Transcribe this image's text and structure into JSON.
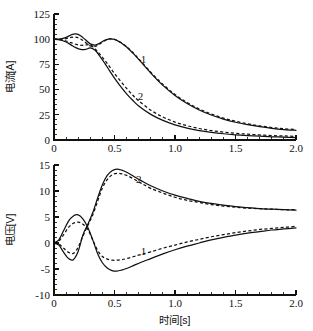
{
  "figure": {
    "title": "",
    "background": "#ffffff",
    "ink_color": "#111111",
    "width": 313,
    "height": 331
  },
  "chart_data": [
    {
      "id": "current-panel",
      "type": "line",
      "title": "",
      "xlabel": "",
      "ylabel": "电流[A]",
      "xlim": [
        0.0,
        2.0
      ],
      "ylim": [
        0,
        125
      ],
      "xticks": [
        0.0,
        0.5,
        1.0,
        1.5,
        2.0
      ],
      "xtick_labels": [
        "0",
        "0.5",
        "1.0",
        "1.5",
        "2.0"
      ],
      "yticks": [
        0,
        25,
        50,
        75,
        100,
        125
      ],
      "ytick_labels": [
        "0",
        "25",
        "50",
        "75",
        "100",
        "125"
      ],
      "minor_tick_count_x": 4,
      "minor_tick_count_y": 4,
      "grid": false,
      "legend": "inline-annotations",
      "annotations": [
        {
          "text": "1",
          "x": 0.74,
          "y": 76.0
        },
        {
          "text": "2",
          "x": 0.715,
          "y": 40.0
        }
      ],
      "series": [
        {
          "name": "1",
          "style": "solid",
          "x": [
            0.0,
            0.05,
            0.1,
            0.14,
            0.18,
            0.22,
            0.26,
            0.3,
            0.34,
            0.38,
            0.42,
            0.46,
            0.5,
            0.55,
            0.6,
            0.65,
            0.7,
            0.8,
            0.9,
            1.0,
            1.1,
            1.2,
            1.3,
            1.4,
            1.5,
            1.6,
            1.7,
            1.8,
            1.9,
            2.0
          ],
          "y": [
            100.0,
            100.2,
            101.8,
            104.2,
            105.2,
            103.4,
            99.4,
            95.4,
            94.2,
            96.2,
            99.0,
            100.3,
            99.8,
            96.8,
            92.2,
            86.4,
            80.0,
            66.4,
            54.2,
            44.2,
            36.2,
            29.8,
            24.8,
            20.8,
            17.6,
            15.2,
            13.2,
            11.6,
            10.4,
            9.6
          ]
        },
        {
          "name": "1-alt",
          "style": "dashed",
          "x": [
            0.0,
            0.05,
            0.1,
            0.14,
            0.18,
            0.22,
            0.26,
            0.3,
            0.34,
            0.38,
            0.42,
            0.46,
            0.5,
            0.55,
            0.6,
            0.65,
            0.7,
            0.8,
            0.9,
            1.0,
            1.1,
            1.2,
            1.3,
            1.4,
            1.5,
            1.6,
            1.7,
            1.8,
            1.9,
            2.0
          ],
          "y": [
            100.0,
            100.0,
            100.6,
            101.8,
            102.0,
            100.2,
            96.8,
            93.4,
            92.8,
            95.4,
            98.6,
            100.2,
            99.8,
            97.0,
            92.6,
            87.0,
            80.6,
            67.2,
            55.2,
            45.2,
            37.2,
            30.8,
            25.8,
            21.8,
            18.6,
            16.0,
            14.0,
            12.4,
            11.2,
            10.4
          ]
        },
        {
          "name": "2",
          "style": "solid",
          "x": [
            0.0,
            0.05,
            0.1,
            0.14,
            0.18,
            0.22,
            0.26,
            0.3,
            0.34,
            0.38,
            0.42,
            0.46,
            0.5,
            0.55,
            0.6,
            0.65,
            0.7,
            0.8,
            0.9,
            1.0,
            1.1,
            1.2,
            1.3,
            1.4,
            1.5,
            1.6,
            1.7,
            1.8,
            1.9,
            2.0
          ],
          "y": [
            100.0,
            99.4,
            97.2,
            94.4,
            91.6,
            89.8,
            89.8,
            91.4,
            89.0,
            83.0,
            76.0,
            68.6,
            61.4,
            53.2,
            45.8,
            39.4,
            33.8,
            25.4,
            19.4,
            15.0,
            11.8,
            9.4,
            7.6,
            6.2,
            5.2,
            4.4,
            3.8,
            3.2,
            2.8,
            2.4
          ]
        },
        {
          "name": "2-alt",
          "style": "dashed",
          "x": [
            0.0,
            0.05,
            0.1,
            0.14,
            0.18,
            0.22,
            0.26,
            0.3,
            0.34,
            0.38,
            0.42,
            0.46,
            0.5,
            0.55,
            0.6,
            0.65,
            0.7,
            0.8,
            0.9,
            1.0,
            1.1,
            1.2,
            1.3,
            1.4,
            1.5,
            1.6,
            1.7,
            1.8,
            1.9,
            2.0
          ],
          "y": [
            100.0,
            99.6,
            98.2,
            96.6,
            95.0,
            94.0,
            94.4,
            94.2,
            90.4,
            85.0,
            79.0,
            72.6,
            66.0,
            58.4,
            51.2,
            44.6,
            38.8,
            29.6,
            22.8,
            17.8,
            14.2,
            11.4,
            9.4,
            7.8,
            6.6,
            5.8,
            5.0,
            4.4,
            4.0,
            3.6
          ]
        }
      ]
    },
    {
      "id": "voltage-panel",
      "type": "line",
      "title": "",
      "xlabel": "时间[s]",
      "ylabel": "电压[V]",
      "xlim": [
        0.0,
        2.0
      ],
      "ylim": [
        -10,
        15
      ],
      "xticks": [
        0.0,
        0.5,
        1.0,
        1.5,
        2.0
      ],
      "xtick_labels": [
        "0",
        "0.5",
        "1.0",
        "1.5",
        "2.0"
      ],
      "yticks": [
        -10,
        -5,
        0,
        5,
        10,
        15
      ],
      "ytick_labels": [
        "-10",
        "-5",
        "0",
        "5",
        "10",
        "15"
      ],
      "minor_tick_count_x": 4,
      "minor_tick_count_y": 4,
      "grid": false,
      "legend": "inline-annotations",
      "annotations": [
        {
          "text": "2",
          "x": 0.7,
          "y": 11.6
        },
        {
          "text": "1",
          "x": 0.74,
          "y": -2.4
        }
      ],
      "series": [
        {
          "name": "2",
          "style": "solid",
          "x": [
            0.0,
            0.04,
            0.08,
            0.12,
            0.16,
            0.2,
            0.24,
            0.28,
            0.32,
            0.36,
            0.4,
            0.44,
            0.48,
            0.52,
            0.56,
            0.6,
            0.66,
            0.72,
            0.8,
            0.9,
            1.0,
            1.1,
            1.2,
            1.3,
            1.4,
            1.5,
            1.6,
            1.7,
            1.8,
            1.9,
            2.0
          ],
          "y": [
            0.0,
            -0.4,
            -1.8,
            -3.0,
            -3.2,
            -1.6,
            1.6,
            3.6,
            5.8,
            8.6,
            11.2,
            13.0,
            13.9,
            14.2,
            14.0,
            13.6,
            12.8,
            12.0,
            11.0,
            10.0,
            9.2,
            8.6,
            8.0,
            7.6,
            7.3,
            7.0,
            6.8,
            6.6,
            6.5,
            6.4,
            6.3
          ]
        },
        {
          "name": "2-alt",
          "style": "dashed",
          "x": [
            0.0,
            0.04,
            0.08,
            0.12,
            0.16,
            0.2,
            0.24,
            0.28,
            0.32,
            0.36,
            0.4,
            0.44,
            0.48,
            0.52,
            0.56,
            0.6,
            0.66,
            0.72,
            0.8,
            0.9,
            1.0,
            1.1,
            1.2,
            1.3,
            1.4,
            1.5,
            1.6,
            1.7,
            1.8,
            1.9,
            2.0
          ],
          "y": [
            0.0,
            -0.2,
            -1.0,
            -1.8,
            -2.0,
            -0.8,
            1.4,
            3.4,
            5.4,
            8.0,
            10.6,
            12.2,
            13.1,
            13.4,
            13.3,
            13.0,
            12.3,
            11.5,
            10.5,
            9.6,
            8.8,
            8.2,
            7.8,
            7.4,
            7.1,
            6.9,
            6.7,
            6.6,
            6.5,
            6.4,
            6.4
          ]
        },
        {
          "name": "1",
          "style": "solid",
          "x": [
            0.0,
            0.04,
            0.08,
            0.12,
            0.16,
            0.2,
            0.24,
            0.28,
            0.32,
            0.36,
            0.4,
            0.44,
            0.48,
            0.52,
            0.56,
            0.6,
            0.66,
            0.72,
            0.8,
            0.9,
            1.0,
            1.1,
            1.2,
            1.3,
            1.4,
            1.5,
            1.6,
            1.7,
            1.8,
            1.9,
            2.0
          ],
          "y": [
            0.0,
            0.6,
            2.4,
            4.2,
            5.2,
            5.4,
            4.6,
            3.0,
            0.6,
            -2.0,
            -3.8,
            -4.8,
            -5.3,
            -5.4,
            -5.2,
            -4.9,
            -4.3,
            -3.7,
            -3.0,
            -2.1,
            -1.3,
            -0.6,
            0.0,
            0.6,
            1.1,
            1.5,
            1.9,
            2.2,
            2.5,
            2.7,
            2.9
          ]
        },
        {
          "name": "1-alt",
          "style": "dashed",
          "x": [
            0.0,
            0.04,
            0.08,
            0.12,
            0.16,
            0.2,
            0.24,
            0.28,
            0.32,
            0.36,
            0.4,
            0.44,
            0.48,
            0.52,
            0.56,
            0.6,
            0.66,
            0.72,
            0.8,
            0.9,
            1.0,
            1.1,
            1.2,
            1.3,
            1.4,
            1.5,
            1.6,
            1.7,
            1.8,
            1.9,
            2.0
          ],
          "y": [
            0.0,
            0.4,
            1.6,
            3.0,
            3.8,
            4.0,
            3.6,
            2.6,
            0.6,
            -1.4,
            -2.6,
            -3.1,
            -3.3,
            -3.3,
            -3.2,
            -3.0,
            -2.6,
            -2.2,
            -1.7,
            -1.0,
            -0.4,
            0.2,
            0.7,
            1.2,
            1.6,
            2.0,
            2.3,
            2.6,
            2.8,
            3.0,
            3.2
          ]
        }
      ]
    }
  ]
}
